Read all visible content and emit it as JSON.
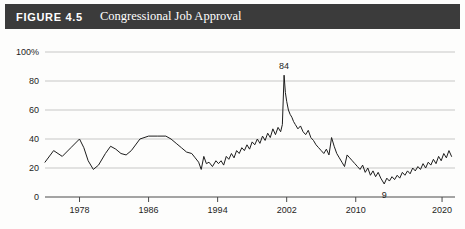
{
  "header": {
    "figure_number": "FIGURE 4.5",
    "title": "Congressional Job Approval",
    "band_color": "#3b3b3b",
    "text_color": "#ffffff"
  },
  "chart_data": {
    "type": "line",
    "title": "Congressional Job Approval",
    "xlabel": "",
    "ylabel": "",
    "xlim": [
      1974,
      2021.5
    ],
    "ylim": [
      0,
      100
    ],
    "grid": true,
    "legend": null,
    "line_color": "#1d1d1d",
    "grid_color": "#b9b9b9",
    "axis_color": "#4a4a4a",
    "y_ticks": [
      0,
      20,
      40,
      60,
      80,
      100
    ],
    "y_tick_labels": [
      "0",
      "20",
      "40",
      "60",
      "80",
      "100%"
    ],
    "x_ticks": [
      1978,
      1986,
      1994,
      2002,
      2010,
      2020
    ],
    "x_tick_labels": [
      "1978",
      "1986",
      "1994",
      "2002",
      "2010",
      "2020"
    ],
    "annotations": [
      {
        "label": "84",
        "x": 2001.7,
        "y": 84,
        "position": "above"
      },
      {
        "label": "9",
        "x": 2013.3,
        "y": 9,
        "position": "below"
      }
    ],
    "series": [
      {
        "name": "Congressional Job Approval",
        "x": [
          1974.0,
          1975.0,
          1976.0,
          1977.0,
          1978.0,
          1978.5,
          1979.0,
          1979.6,
          1980.2,
          1981.0,
          1981.6,
          1982.2,
          1982.8,
          1983.4,
          1984.0,
          1985.0,
          1986.0,
          1987.0,
          1988.0,
          1988.6,
          1989.2,
          1989.8,
          1990.4,
          1991.0,
          1991.4,
          1991.8,
          1992.1,
          1992.4,
          1992.7,
          1993.0,
          1993.4,
          1993.8,
          1994.1,
          1994.4,
          1994.7,
          1995.0,
          1995.3,
          1995.6,
          1995.9,
          1996.2,
          1996.5,
          1996.8,
          1997.1,
          1997.4,
          1997.7,
          1998.0,
          1998.3,
          1998.6,
          1998.9,
          1999.2,
          1999.5,
          1999.8,
          2000.1,
          2000.4,
          2000.7,
          2001.0,
          2001.3,
          2001.5,
          2001.7,
          2001.85,
          2002.0,
          2002.2,
          2002.4,
          2002.6,
          2002.8,
          2003.0,
          2003.3,
          2003.6,
          2003.9,
          2004.2,
          2004.5,
          2004.8,
          2005.1,
          2005.4,
          2005.7,
          2006.0,
          2006.3,
          2006.6,
          2006.9,
          2007.2,
          2007.5,
          2007.8,
          2008.1,
          2008.4,
          2008.7,
          2009.0,
          2009.3,
          2009.6,
          2009.9,
          2010.2,
          2010.5,
          2010.8,
          2011.1,
          2011.4,
          2011.7,
          2012.0,
          2012.3,
          2012.6,
          2012.9,
          2013.3,
          2013.6,
          2013.9,
          2014.2,
          2014.5,
          2014.8,
          2015.1,
          2015.4,
          2015.7,
          2016.0,
          2016.3,
          2016.6,
          2016.9,
          2017.2,
          2017.5,
          2017.8,
          2018.1,
          2018.4,
          2018.7,
          2019.0,
          2019.3,
          2019.6,
          2019.9,
          2020.2,
          2020.5,
          2020.8,
          2021.1
        ],
        "values": [
          24,
          32,
          28,
          34,
          40,
          34,
          25,
          19,
          22,
          30,
          35,
          33,
          30,
          29,
          32,
          40,
          42,
          42,
          42,
          40,
          37,
          34,
          31,
          30,
          27,
          24,
          19,
          28,
          23,
          24,
          21,
          25,
          23,
          25,
          22,
          28,
          26,
          30,
          27,
          32,
          30,
          34,
          32,
          36,
          33,
          38,
          36,
          40,
          37,
          42,
          39,
          44,
          41,
          47,
          43,
          48,
          45,
          50,
          84,
          72,
          66,
          60,
          57,
          55,
          52,
          50,
          47,
          49,
          45,
          43,
          46,
          41,
          39,
          36,
          34,
          32,
          30,
          33,
          29,
          41,
          35,
          30,
          27,
          24,
          21,
          29,
          27,
          25,
          23,
          21,
          19,
          22,
          17,
          20,
          15,
          18,
          14,
          17,
          13,
          9,
          13,
          11,
          14,
          12,
          15,
          13,
          17,
          15,
          18,
          16,
          20,
          18,
          21,
          19,
          23,
          20,
          24,
          22,
          26,
          23,
          28,
          25,
          30,
          27,
          32,
          28
        ]
      }
    ]
  }
}
